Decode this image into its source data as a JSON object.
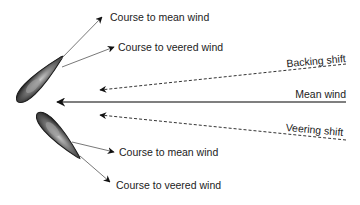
{
  "diagram": {
    "labels": {
      "top_course_mean": "Course to mean wind",
      "top_course_veered": "Course to veered wind",
      "backing_shift": "Backing shift",
      "mean_wind": "Mean wind",
      "veering_shift": "Veering shift",
      "bottom_course_mean": "Course to mean wind",
      "bottom_course_veered": "Course to veered wind"
    },
    "colors": {
      "line": "#555555",
      "arrowhead": "#111111",
      "text": "#222222",
      "hull_dark": "#2a2a2a",
      "hull_light": "#b0b0b0"
    }
  }
}
